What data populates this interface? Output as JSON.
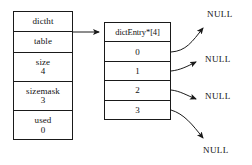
{
  "diagram": {
    "struct": {
      "name": "dictht",
      "fields": [
        {
          "key": "table",
          "value": ""
        },
        {
          "key": "size",
          "value": "4"
        },
        {
          "key": "sizemask",
          "value": "3"
        },
        {
          "key": "used",
          "value": "0"
        }
      ]
    },
    "array": {
      "header": "dictEntry*[4]",
      "indices": [
        "0",
        "1",
        "2",
        "3"
      ]
    },
    "null_nodes": [
      {
        "label": "NULL"
      },
      {
        "label": "NULL"
      },
      {
        "label": "NULL"
      },
      {
        "label": "NULL"
      }
    ],
    "colors": {
      "stroke": "#1a1a1a",
      "text": "#111111",
      "background": "#ffffff"
    }
  }
}
